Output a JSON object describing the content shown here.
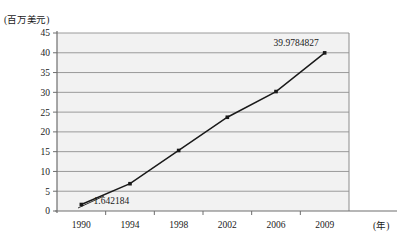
{
  "chart_data": {
    "type": "line",
    "title": "",
    "xlabel": "(年)",
    "ylabel": "(百万美元)",
    "x": [
      "1990",
      "1994",
      "1998",
      "2002",
      "2006",
      "2009"
    ],
    "categories": [
      "1990",
      "1994",
      "1998",
      "2002",
      "2006",
      "2009"
    ],
    "values": [
      1.642184,
      6.9,
      15.3,
      23.7,
      30.2,
      39.9784827
    ],
    "series": [
      {
        "name": "",
        "values": [
          1.642184,
          6.9,
          15.3,
          23.7,
          30.2,
          39.9784827
        ]
      }
    ],
    "point_labels": [
      {
        "index": 0,
        "text": "1.642184"
      },
      {
        "index": 5,
        "text": "39.9784827"
      }
    ],
    "ylim": [
      0,
      45
    ],
    "ytick_labels": [
      "0",
      "5",
      "10",
      "15",
      "20",
      "25",
      "30",
      "35",
      "40",
      "45"
    ],
    "ytick_values": [
      0,
      5,
      10,
      15,
      20,
      25,
      30,
      35,
      40,
      45
    ],
    "xtick_labels": [
      "1990",
      "1994",
      "1998",
      "2002",
      "2006",
      "2009"
    ],
    "grid": "horizontal",
    "legend": "none",
    "plot_background": "#f2f2f2",
    "line_color": "#1a1a1a",
    "marker_color": "#1a1a1a",
    "gridline_color": "#9a9a9a",
    "axis_color": "#6e6e6e"
  },
  "axis": {
    "y_unit_caption": "(百万美元)",
    "x_unit_caption": "(年)"
  }
}
